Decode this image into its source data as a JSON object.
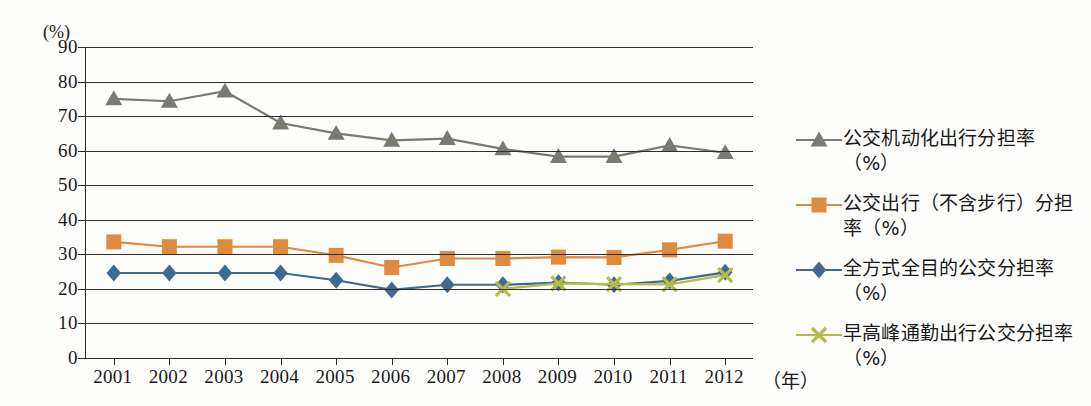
{
  "chart_data": {
    "type": "line",
    "title": "",
    "subtitle": "",
    "xlabel": "（年）",
    "ylabel": "(%)",
    "x": [
      2001,
      2002,
      2003,
      2004,
      2005,
      2006,
      2007,
      2008,
      2009,
      2010,
      2011,
      2012
    ],
    "categories": [
      "2001",
      "2002",
      "2003",
      "2004",
      "2005",
      "2006",
      "2007",
      "2008",
      "2009",
      "2010",
      "2011",
      "2012"
    ],
    "xlim": [
      2000.5,
      2012.5
    ],
    "ylim": [
      0,
      90
    ],
    "yticks": [
      0,
      10,
      20,
      30,
      40,
      50,
      60,
      70,
      80,
      90
    ],
    "ytick_labels": [
      "0",
      "10",
      "20",
      "30",
      "40",
      "50",
      "60",
      "70",
      "80",
      "90"
    ],
    "grid": "horizontal",
    "legend_position": "right",
    "series": [
      {
        "name": "公交机动化出行分担率（%）",
        "color": "#7a7a72",
        "marker": "triangle",
        "values": [
          75.0,
          74.3,
          77.2,
          68.0,
          65.0,
          63.0,
          63.5,
          60.5,
          58.3,
          58.3,
          61.5,
          59.4
        ]
      },
      {
        "name": "公交出行（不含步行）分担率（%）",
        "color": "#df8a3e",
        "marker": "square",
        "values": [
          33.6,
          32.2,
          32.2,
          32.2,
          29.7,
          26.2,
          28.8,
          28.8,
          29.2,
          29.1,
          31.3,
          33.8
        ]
      },
      {
        "name": "全方式全目的公交分担率（%）",
        "color": "#42688f",
        "marker": "diamond",
        "values": [
          24.6,
          24.6,
          24.6,
          24.6,
          22.5,
          19.7,
          21.2,
          21.2,
          21.8,
          21.2,
          22.3,
          24.8
        ]
      },
      {
        "name": "早高峰通勤出行公交分担率（%）",
        "color": "#b7bb4c",
        "marker": "cross",
        "values": [
          null,
          null,
          null,
          null,
          null,
          null,
          null,
          20.0,
          21.6,
          21.4,
          21.3,
          24.0
        ]
      }
    ]
  },
  "legend": {
    "items": [
      {
        "label": "公交机动化出行分担率（%）",
        "color": "#7a7a72",
        "marker": "triangle"
      },
      {
        "label": "公交出行（不含步行）分担率（%）",
        "color": "#df8a3e",
        "marker": "square"
      },
      {
        "label": "全方式全目的公交分担率（%）",
        "color": "#42688f",
        "marker": "diamond"
      },
      {
        "label": "早高峰通勤出行公交分担率（%）",
        "color": "#b7bb4c",
        "marker": "cross"
      }
    ]
  },
  "axes": {
    "y_unit": "(%)",
    "x_unit": "（年）"
  }
}
